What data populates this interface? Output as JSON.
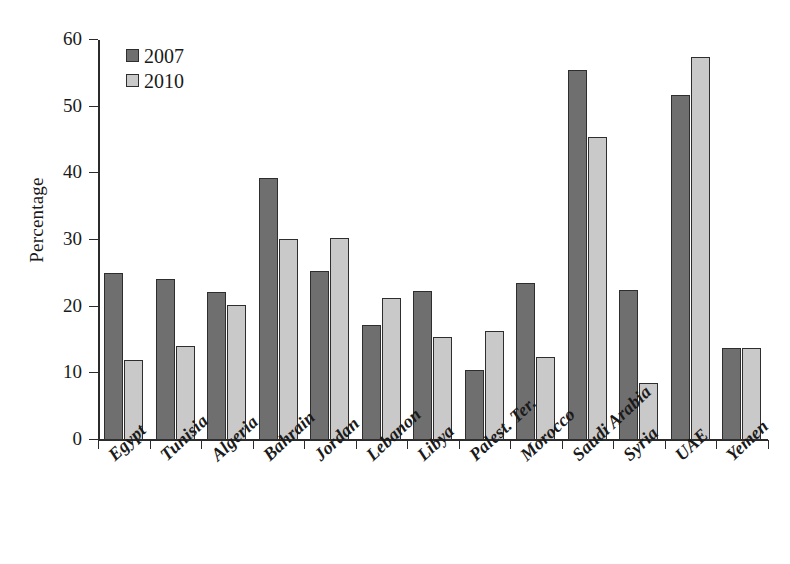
{
  "chart_data": {
    "type": "bar",
    "title": "",
    "xlabel": "",
    "ylabel": "Percentage",
    "ylim": [
      0,
      60
    ],
    "yticks": [
      0,
      10,
      20,
      30,
      40,
      50,
      60
    ],
    "grid": false,
    "legend_position": "top-left",
    "categories": [
      "Egypt",
      "Tunisia",
      "Algeria",
      "Bahrain",
      "Jordan",
      "Lebanon",
      "Libya",
      "Palest. Ter.",
      "Morocco",
      "Saudi Arabia",
      "Syria",
      "UAE",
      "Yemen"
    ],
    "series": [
      {
        "name": "2007",
        "color": "#6f6f6f",
        "values": [
          25.0,
          24.2,
          22.2,
          39.3,
          25.3,
          17.3,
          22.3,
          10.5,
          23.5,
          55.5,
          22.5,
          51.8,
          13.8
        ]
      },
      {
        "name": "2010",
        "color": "#c9c9c9",
        "values": [
          12.0,
          14.1,
          20.2,
          30.2,
          30.3,
          21.3,
          15.4,
          16.4,
          12.5,
          45.5,
          8.6,
          57.5,
          13.8
        ]
      }
    ]
  }
}
